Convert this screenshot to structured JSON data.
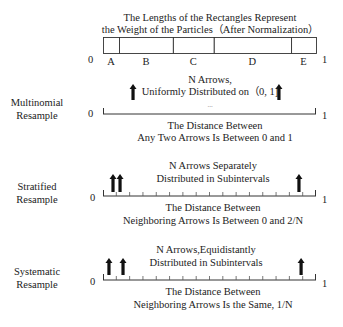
{
  "weights": {
    "title_line1": "The Lengths of the Rectangles Represent",
    "title_line2": "the Weight of the Particles（After Normalization）",
    "zero": "0",
    "one": "1",
    "segments": [
      {
        "label": "A",
        "start": 0.0,
        "end": 0.075
      },
      {
        "label": "B",
        "start": 0.075,
        "end": 0.328
      },
      {
        "label": "C",
        "start": 0.328,
        "end": 0.52
      },
      {
        "label": "D",
        "start": 0.52,
        "end": 0.883
      },
      {
        "label": "E",
        "start": 0.883,
        "end": 1.0
      }
    ]
  },
  "multinomial": {
    "name_line1": "Multinomial",
    "name_line2": "Resample",
    "top_line1": "N Arrows,",
    "top_line2": "Uniformly Distributed on（0, 1]",
    "ellipsis": "...",
    "bottom_line1": "The Distance Between",
    "bottom_line2": "Any Two Arrows Is Between 0 and 1",
    "zero": "0",
    "one": "1",
    "arrows": [
      0.141,
      0.826
    ],
    "ticks": 0
  },
  "stratified": {
    "name_line1": "Stratified",
    "name_line2": "Resample",
    "top_line1": "N Arrows Separately",
    "top_line2": "Distributed in Subintervals",
    "bottom_line1": "The Distance Between",
    "bottom_line2": "Neighboring Arrows Is Between 0 and 2/N",
    "zero": "0",
    "one": "1",
    "arrows": [
      0.047,
      0.08,
      0.92
    ],
    "ticks": 16
  },
  "systematic": {
    "name_line1": "Systematic",
    "name_line2": "Resample",
    "top_line1": "N Arrows,Equidistantly",
    "top_line2": "Distributed in Subintervals",
    "bottom_line1": "The Distance Between",
    "bottom_line2": "Neighboring Arrows Is the Same, 1/N",
    "zero": "0",
    "one": "1",
    "arrows": [
      0.028,
      0.094,
      0.93
    ],
    "ticks": 16
  }
}
